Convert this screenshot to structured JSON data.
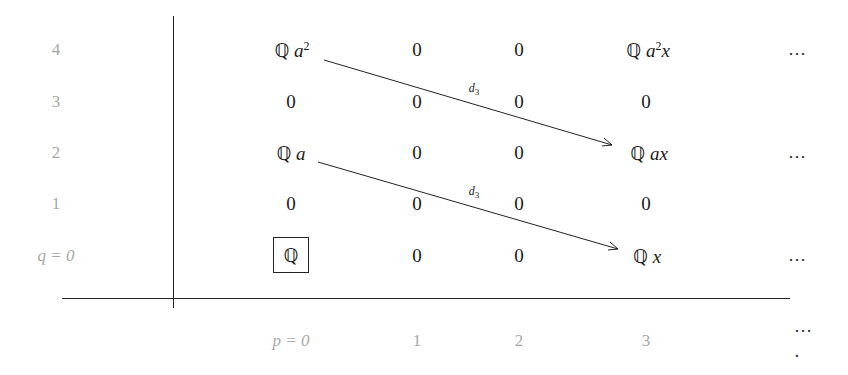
{
  "diagram": {
    "type": "spectral-sequence-page",
    "row_labels": [
      "4",
      "3",
      "2",
      "1",
      "q = 0"
    ],
    "column_labels": [
      "p = 0",
      "1",
      "2",
      "3"
    ],
    "trailing_dots": "⋯",
    "trailing_dots_final": "⋯ .",
    "rows": [
      {
        "q": "4",
        "cells": [
          "ℚ a²",
          "0",
          "0",
          "ℚ a²x"
        ]
      },
      {
        "q": "3",
        "cells": [
          "0",
          "0",
          "0",
          "0"
        ]
      },
      {
        "q": "2",
        "cells": [
          "ℚ a",
          "0",
          "0",
          "ℚ ax"
        ]
      },
      {
        "q": "1",
        "cells": [
          "0",
          "0",
          "0",
          "0"
        ]
      },
      {
        "q": "0",
        "cells": [
          "ℚ",
          "0",
          "0",
          "ℚ x"
        ]
      }
    ],
    "boxed_cell": {
      "row": "q = 0",
      "column": "p = 0",
      "value": "ℚ"
    },
    "differentials": [
      {
        "label": "d3",
        "from": "ℚ a²",
        "to": "ℚ ax"
      },
      {
        "label": "d3",
        "from": "ℚ a",
        "to": "ℚ x"
      }
    ]
  }
}
